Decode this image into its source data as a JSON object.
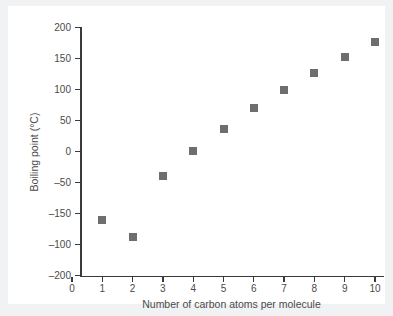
{
  "chart_data": {
    "type": "scatter",
    "title": "",
    "xlabel": "Number of carbon atoms per molecule",
    "ylabel": "Boiling point (°C)",
    "x": [
      1,
      2,
      3,
      4,
      5,
      6,
      7,
      8,
      9,
      10
    ],
    "values": [
      -110,
      -138,
      -40,
      1,
      37,
      70,
      99,
      126,
      152,
      176
    ],
    "points": [
      {
        "x": 1,
        "y": -110
      },
      {
        "x": 2,
        "y": -138
      },
      {
        "x": 3,
        "y": -40
      },
      {
        "x": 4,
        "y": 1
      },
      {
        "x": 5,
        "y": 37
      },
      {
        "x": 6,
        "y": 70
      },
      {
        "x": 7,
        "y": 99
      },
      {
        "x": 8,
        "y": 126
      },
      {
        "x": 9,
        "y": 152
      },
      {
        "x": 10,
        "y": 176
      }
    ],
    "xlim": [
      0,
      10
    ],
    "ylim": [
      -200,
      200
    ],
    "xticks": [
      "0",
      "1",
      "2",
      "3",
      "4",
      "5",
      "6",
      "7",
      "8",
      "9",
      "10"
    ],
    "yticks": [
      "200",
      "150",
      "100",
      "50",
      "0",
      "–50",
      "–150",
      "–100",
      "–200"
    ],
    "grid": false,
    "legend": "none",
    "marker_color": "#6e6e6e",
    "marker_shape": "square",
    "axis_color": "#3a3a3a",
    "text_color": "#4a4a4a",
    "background_color": "#ffffff",
    "page_color": "#f1f2f3"
  }
}
